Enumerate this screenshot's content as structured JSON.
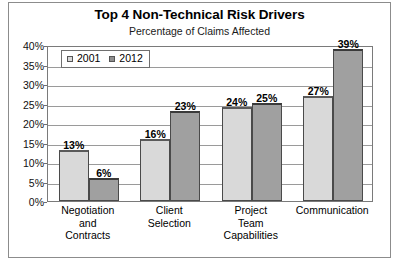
{
  "chart_data": {
    "type": "bar",
    "title": "Top 4 Non-Technical Risk Drivers",
    "subtitle": "Percentage of Claims Affected",
    "xlabel": "",
    "ylabel": "",
    "ylim": [
      0,
      40
    ],
    "ytick_step": 5,
    "ytick_labels": [
      "0%",
      "5%",
      "10%",
      "15%",
      "20%",
      "25%",
      "30%",
      "35%",
      "40%"
    ],
    "ytick_values": [
      0,
      5,
      10,
      15,
      20,
      25,
      30,
      35,
      40
    ],
    "grid": true,
    "legend_position": "top-left-inside",
    "categories": [
      "Negotiation and Contracts",
      "Client Selection",
      "Project Team Capabilities",
      "Communication"
    ],
    "category_lines": [
      [
        "Negotiation",
        "and",
        "Contracts"
      ],
      [
        "Client",
        "Selection"
      ],
      [
        "Project",
        "Team",
        "Capabilities"
      ],
      [
        "Communication"
      ]
    ],
    "series": [
      {
        "name": "2001",
        "color": "#d9d9d9",
        "values": [
          13,
          16,
          24,
          27
        ],
        "labels": [
          "13%",
          "16%",
          "24%",
          "27%"
        ]
      },
      {
        "name": "2012",
        "color": "#a0a0a0",
        "values": [
          6,
          23,
          25,
          39
        ],
        "labels": [
          "6%",
          "23%",
          "25%",
          "39%"
        ]
      }
    ]
  },
  "legend": {
    "entries": [
      {
        "label": "2001"
      },
      {
        "label": "2012"
      }
    ]
  },
  "colors": {
    "series_2001": "#d9d9d9",
    "series_2012": "#a0a0a0",
    "axis": "#7a7a7a",
    "grid": "#9a9a9a",
    "text": "#000000",
    "background": "#ffffff"
  }
}
